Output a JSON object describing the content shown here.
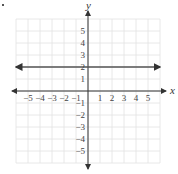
{
  "chart_data": {
    "type": "line",
    "title": "",
    "xlabel": "x",
    "ylabel": "y",
    "xlim": [
      -6,
      6
    ],
    "ylim": [
      -6,
      6
    ],
    "grid": true,
    "x_ticks": [
      "-5",
      "-4",
      "-3",
      "-2",
      "-1",
      "1",
      "2",
      "3",
      "4",
      "5"
    ],
    "y_ticks": [
      "5",
      "4",
      "3",
      "2",
      "1",
      "-1",
      "-2",
      "-3",
      "-4",
      "-5"
    ],
    "series": [
      {
        "name": "y = 2",
        "x": [
          -6,
          6
        ],
        "y": [
          2,
          2
        ],
        "color": "#555555",
        "arrows": "both"
      }
    ]
  },
  "labels": {
    "x_axis": "x",
    "y_axis": "y",
    "x_neg": [
      "−5",
      "−4",
      "−3",
      "−2",
      "−1"
    ],
    "x_pos": [
      "1",
      "2",
      "3",
      "4",
      "5"
    ],
    "y_pos": [
      "5",
      "4",
      "3",
      "2",
      "1"
    ],
    "y_neg": [
      "−1",
      "−2",
      "−3",
      "−4",
      "−5"
    ]
  }
}
